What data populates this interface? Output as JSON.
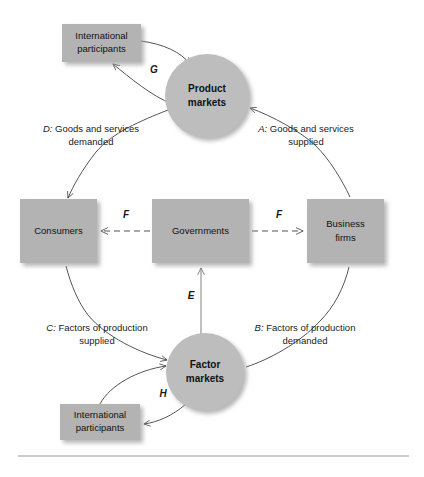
{
  "figure": {
    "type": "circular-flow-diagram",
    "nodes": [
      {
        "id": "international-top",
        "shape": "box",
        "line1": "International",
        "line2": "participants"
      },
      {
        "id": "product-markets",
        "shape": "circle",
        "line1": "Product",
        "line2": "markets"
      },
      {
        "id": "consumers",
        "shape": "box",
        "line1": "Consumers",
        "line2": ""
      },
      {
        "id": "governments",
        "shape": "box",
        "line1": "Governments",
        "line2": ""
      },
      {
        "id": "business-firms",
        "shape": "box",
        "line1": "Business",
        "line2": "firms"
      },
      {
        "id": "factor-markets",
        "shape": "circle",
        "line1": "Factor",
        "line2": "markets"
      },
      {
        "id": "international-bottom",
        "shape": "box",
        "line1": "International",
        "line2": "participants"
      }
    ],
    "flows": [
      {
        "id": "A",
        "key": "A:",
        "line1": "Goods and services",
        "line2": "supplied",
        "from": "business-firms",
        "to": "product-markets"
      },
      {
        "id": "B",
        "key": "B:",
        "line1": "Factors of production",
        "line2": "demanded",
        "from": "business-firms",
        "to": "factor-markets"
      },
      {
        "id": "C",
        "key": "C:",
        "line1": "Factors of production",
        "line2": "supplied",
        "from": "consumers",
        "to": "factor-markets"
      },
      {
        "id": "D",
        "key": "D:",
        "line1": "Goods and services",
        "line2": "demanded",
        "from": "product-markets",
        "to": "consumers"
      },
      {
        "id": "E",
        "key": "E",
        "line1": "",
        "line2": "",
        "from": "factor-markets",
        "to": "governments"
      },
      {
        "id": "F-left",
        "key": "F",
        "line1": "",
        "line2": "",
        "from": "governments",
        "to": "consumers"
      },
      {
        "id": "F-right",
        "key": "F",
        "line1": "",
        "line2": "",
        "from": "governments",
        "to": "business-firms"
      },
      {
        "id": "G",
        "key": "G",
        "line1": "",
        "line2": "",
        "from": "international-top",
        "to": "product-markets"
      },
      {
        "id": "H",
        "key": "H",
        "line1": "",
        "line2": "",
        "from": "factor-markets",
        "to": "international-bottom"
      }
    ],
    "colors": {
      "box_fill": "#b3b3b3",
      "circle_fill": "#bdbdbd",
      "arrow_stroke": "#545454",
      "text": "#111111",
      "rule": "#9a9a9a",
      "background": "#ffffff"
    }
  }
}
